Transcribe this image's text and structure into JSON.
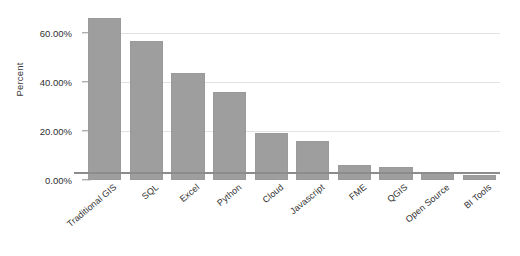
{
  "chart_data": {
    "type": "bar",
    "title": "",
    "xlabel": "",
    "ylabel": "Percent",
    "ylim": [
      0,
      70
    ],
    "grid": true,
    "legend": false,
    "bar_color": "#9e9e9e",
    "categories": [
      "Traditional GIS",
      "SQL",
      "Excel",
      "Python",
      "Cloud",
      "Javascript",
      "FME",
      "QGIS",
      "Open Source",
      "BI Tools"
    ],
    "values": [
      66.0,
      56.5,
      43.5,
      36.0,
      19.0,
      15.8,
      6.0,
      5.5,
      3.0,
      2.0
    ],
    "ytick_values": [
      0,
      20,
      40,
      60
    ],
    "ytick_labels": [
      "0.00%",
      "20.00%",
      "40.00%",
      "60.00%"
    ]
  }
}
